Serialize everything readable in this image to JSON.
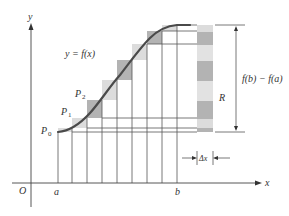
{
  "diagram": {
    "axes": {
      "x_label": "x",
      "y_label": "y",
      "origin_label": "O",
      "a_label": "a",
      "b_label": "b"
    },
    "curve_label": "y = f(x)",
    "points": [
      {
        "label": "P",
        "sub": "0"
      },
      {
        "label": "P",
        "sub": "1"
      },
      {
        "label": "P",
        "sub": "2"
      }
    ],
    "strip_label": "R",
    "height_label": "f(b) − f(a)",
    "width_label": "Δx",
    "colors": {
      "curve": "#4a4a4a",
      "dark_cell": "#b3b3b3",
      "light_cell": "#dcdcdc",
      "lines": "#555555"
    }
  }
}
